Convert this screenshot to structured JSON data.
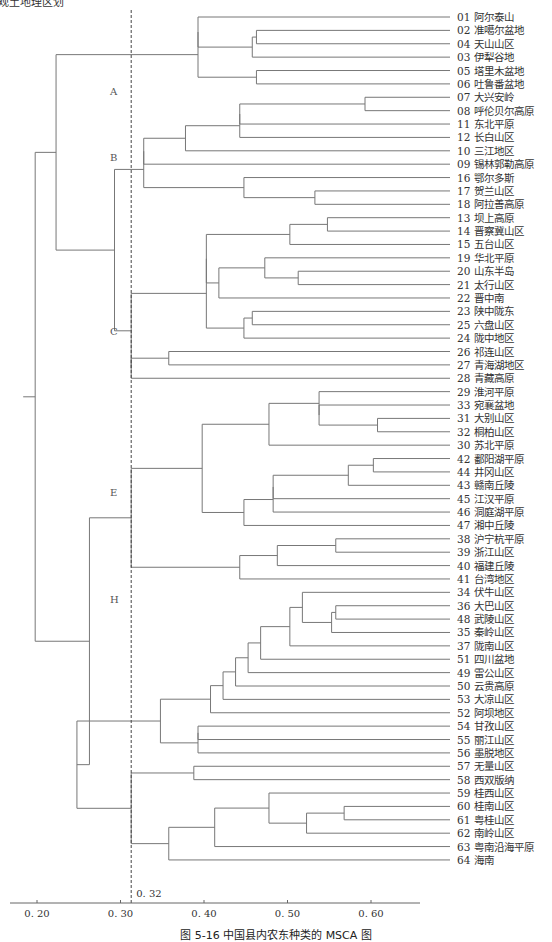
{
  "top_note": "观土地理区划",
  "caption": "图 5-16  中国县内农东种类的 MSCA 图",
  "chart_data": {
    "type": "dendrogram",
    "title": "",
    "xlabel": "",
    "ylabel": "",
    "xlim": [
      0.18,
      0.66
    ],
    "x_ticks": [
      0.2,
      0.3,
      0.4,
      0.5,
      0.6
    ],
    "x_tick_labels": [
      "0. 20",
      "0. 30",
      "0. 40",
      "0. 50",
      "0. 60"
    ],
    "cut_line": {
      "value": 0.32,
      "label": "0. 32",
      "style": "dashed"
    },
    "cluster_labels": [
      {
        "label": "A",
        "leaf_pos": 5.5
      },
      {
        "label": "B",
        "leaf_pos": 10.5
      },
      {
        "label": "C",
        "leaf_pos": 23.5
      },
      {
        "label": "E",
        "leaf_pos": 35.5
      },
      {
        "label": "H",
        "leaf_pos": 43.5
      }
    ],
    "leaves": [
      "01 阿尔泰山",
      "02 准噶尔盆地",
      "04 天山山区",
      "03 伊犁谷地",
      "05 塔里木盆地",
      "06 吐鲁番盆地",
      "07 大兴安岭",
      "08 呼伦贝尔高原",
      "11 东北平原",
      "12 长白山区",
      "10 三江地区",
      "09 锡林郭勒高原",
      "16 鄂尔多斯",
      "17 贺兰山区",
      "18 阿拉善高原",
      "13 坝上高原",
      "14 晋察冀山区",
      "15 五台山区",
      "19 华北平原",
      "20 山东半岛",
      "21 太行山区",
      "22 晋中南",
      "23 陕中陇东",
      "25 六盘山区",
      "24 陇中地区",
      "26 祁连山区",
      "27 青海湖地区",
      "28 青藏高原",
      "29 淮河平原",
      "33 宛襄盆地",
      "31 大别山区",
      "32 桐柏山区",
      "30 苏北平原",
      "42 鄱阳湖平原",
      "44 井冈山区",
      "43 赣南丘陵",
      "45 江汉平原",
      "46 洞庭湖平原",
      "47 湘中丘陵",
      "38 沪宁杭平原",
      "39 浙江山区",
      "40 福建丘陵",
      "41 台湾地区",
      "34 伏牛山区",
      "36 大巴山区",
      "48 武陵山区",
      "35 秦岭山区",
      "37 陇南山区",
      "51 四川盆地",
      "49 雷公山区",
      "50 云贵高原",
      "53 大凉山区",
      "52 阿坝地区",
      "54 甘孜山区",
      "55 丽江山区",
      "56 墨脱地区",
      "57 无量山区",
      "58 西双版纳",
      "59 桂西山区",
      "60 桂南山区",
      "61 粤桂山区",
      "62 南岭山区",
      "63 粤南沿海平原",
      "64 海南"
    ],
    "merges": [
      {
        "id": "m1",
        "a": 1,
        "b": 2,
        "h": 0.47
      },
      {
        "id": "m2",
        "a": "m1",
        "b": 3,
        "h": 0.465
      },
      {
        "id": "m3",
        "a": 4,
        "b": 5,
        "h": 0.47
      },
      {
        "id": "m4",
        "a": 0,
        "b": "m2",
        "h": 0.4
      },
      {
        "id": "A",
        "a": "m4",
        "b": "m3",
        "h": 0.4
      },
      {
        "id": "m6",
        "a": 6,
        "b": 7,
        "h": 0.6
      },
      {
        "id": "m7",
        "a": "m6",
        "b": 8,
        "h": 0.45
      },
      {
        "id": "m8",
        "a": "m7",
        "b": 9,
        "h": 0.45
      },
      {
        "id": "m9",
        "a": "m8",
        "b": 10,
        "h": 0.385
      },
      {
        "id": "m10",
        "a": 13,
        "b": 14,
        "h": 0.54
      },
      {
        "id": "m11",
        "a": 12,
        "b": "m10",
        "h": 0.455
      },
      {
        "id": "m12",
        "a": "m9",
        "b": 11,
        "h": 0.335
      },
      {
        "id": "B",
        "a": "m12",
        "b": "m11",
        "h": 0.335
      },
      {
        "id": "m14",
        "a": 15,
        "b": 16,
        "h": 0.555
      },
      {
        "id": "m15",
        "a": "m14",
        "b": 17,
        "h": 0.51
      },
      {
        "id": "m16",
        "a": 19,
        "b": 20,
        "h": 0.52
      },
      {
        "id": "m17",
        "a": 18,
        "b": "m16",
        "h": 0.48
      },
      {
        "id": "m18",
        "a": "m17",
        "b": 21,
        "h": 0.425
      },
      {
        "id": "m19",
        "a": "m18",
        "b": "m15",
        "h": 0.41
      },
      {
        "id": "m20",
        "a": 22,
        "b": 23,
        "h": 0.465
      },
      {
        "id": "m21",
        "a": "m20",
        "b": 24,
        "h": 0.455
      },
      {
        "id": "m22",
        "a": "m19",
        "b": "m21",
        "h": 0.41
      },
      {
        "id": "m23",
        "a": 25,
        "b": 26,
        "h": 0.365
      },
      {
        "id": "m24",
        "a": "m23",
        "b": 27,
        "h": 0.32
      },
      {
        "id": "C",
        "a": "m22",
        "b": "m24",
        "h": 0.32
      },
      {
        "id": "BC",
        "a": "B",
        "b": "C",
        "h": 0.3
      },
      {
        "id": "ABC",
        "a": "A",
        "b": "BC",
        "h": 0.23
      },
      {
        "id": "m30",
        "a": 30,
        "b": 31,
        "h": 0.615
      },
      {
        "id": "m31",
        "a": 29,
        "b": "m30",
        "h": 0.545
      },
      {
        "id": "m32",
        "a": 28,
        "b": "m31",
        "h": 0.545
      },
      {
        "id": "m33",
        "a": "m32",
        "b": 32,
        "h": 0.485
      },
      {
        "id": "m34",
        "a": 33,
        "b": 34,
        "h": 0.61
      },
      {
        "id": "m35",
        "a": "m34",
        "b": 35,
        "h": 0.58
      },
      {
        "id": "m36",
        "a": "m35",
        "b": 36,
        "h": 0.49
      },
      {
        "id": "m37",
        "a": "m36",
        "b": 37,
        "h": 0.49
      },
      {
        "id": "m38",
        "a": "m37",
        "b": 38,
        "h": 0.455
      },
      {
        "id": "m39",
        "a": "m33",
        "b": "m38",
        "h": 0.405
      },
      {
        "id": "m40",
        "a": 39,
        "b": 40,
        "h": 0.565
      },
      {
        "id": "m41",
        "a": "m40",
        "b": 41,
        "h": 0.495
      },
      {
        "id": "m42",
        "a": "m41",
        "b": 42,
        "h": 0.45
      },
      {
        "id": "E",
        "a": "m39",
        "b": "m42",
        "h": 0.32
      },
      {
        "id": "m44",
        "a": 44,
        "b": 45,
        "h": 0.565
      },
      {
        "id": "m45",
        "a": "m44",
        "b": 46,
        "h": 0.56
      },
      {
        "id": "m46",
        "a": 43,
        "b": "m45",
        "h": 0.525
      },
      {
        "id": "m47",
        "a": "m46",
        "b": 47,
        "h": 0.51
      },
      {
        "id": "m48",
        "a": "m47",
        "b": 48,
        "h": 0.475
      },
      {
        "id": "m49",
        "a": "m48",
        "b": 49,
        "h": 0.46
      },
      {
        "id": "m50",
        "a": "m49",
        "b": 50,
        "h": 0.445
      },
      {
        "id": "m51",
        "a": "m50",
        "b": 51,
        "h": 0.43
      },
      {
        "id": "m52",
        "a": "m51",
        "b": 52,
        "h": 0.415
      },
      {
        "id": "m53",
        "a": 53,
        "b": 54,
        "h": 0.4
      },
      {
        "id": "m54",
        "a": "m53",
        "b": 55,
        "h": 0.4
      },
      {
        "id": "m55",
        "a": "m52",
        "b": "m54",
        "h": 0.355
      },
      {
        "id": "m56",
        "a": 56,
        "b": 57,
        "h": 0.395
      },
      {
        "id": "m57",
        "a": 59,
        "b": 60,
        "h": 0.575
      },
      {
        "id": "m58",
        "a": "m57",
        "b": 61,
        "h": 0.53
      },
      {
        "id": "m59",
        "a": 58,
        "b": "m58",
        "h": 0.485
      },
      {
        "id": "m60",
        "a": "m59",
        "b": 62,
        "h": 0.42
      },
      {
        "id": "m61",
        "a": "m60",
        "b": 63,
        "h": 0.365
      },
      {
        "id": "m62",
        "a": "m56",
        "b": "m61",
        "h": 0.32
      },
      {
        "id": "H",
        "a": "m55",
        "b": "m62",
        "h": 0.255
      },
      {
        "id": "EH",
        "a": "E",
        "b": "H",
        "h": 0.27
      },
      {
        "id": "root",
        "a": "ABC",
        "b": "EH",
        "h": 0.205
      }
    ]
  },
  "layout": {
    "px_per_unit": 835,
    "x_origin_value": 0.2,
    "x_origin_px": 31,
    "leaf_top_px": 17,
    "leaf_step_px": 13.38,
    "leaf_end_px": 450,
    "label_x_px": 457,
    "axis_y_px": 903,
    "root_stub_px": 12,
    "line_color": "#777777",
    "text_color": "#333333"
  }
}
